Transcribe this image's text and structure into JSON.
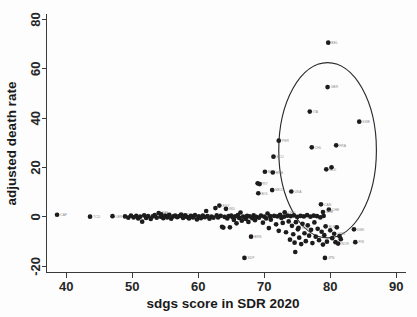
{
  "chart_data": {
    "type": "scatter",
    "title": "",
    "xlabel": "sdgs score in SDR 2020",
    "ylabel": "adjusted death rate",
    "xlim": [
      37,
      90.5
    ],
    "ylim": [
      -22.5,
      82
    ],
    "xticks": [
      40,
      50,
      60,
      70,
      80,
      90
    ],
    "yticks": [
      -20,
      0,
      20,
      40,
      60,
      80
    ],
    "grid": false,
    "legend": null,
    "marker_color": "#1c1c1c",
    "label_color": "#8a8a8a",
    "axis_color": "#3a3a3a",
    "background": "#fdfdfd",
    "annotations": [
      {
        "kind": "ellipse",
        "name": "highlight-ellipse",
        "cx": 79.6,
        "cy": 27.0,
        "rx": 7.4,
        "ry": 35.5,
        "stroke": "#2b2b2b",
        "encloses": [
          "BEL",
          "GBR",
          "ITA",
          "SWE",
          "PER",
          "CHL",
          "FRA",
          "ECU",
          "NLD",
          "USA",
          "CAN",
          "CHE"
        ]
      }
    ],
    "points": [
      {
        "label": "CAF",
        "x": 38.6,
        "y": 0.9
      },
      {
        "label": "TCD",
        "x": 43.6,
        "y": 0.1
      },
      {
        "label": "LBR",
        "x": 47.0,
        "y": 0.3
      },
      {
        "label": "",
        "x": 48.9,
        "y": 0.2
      },
      {
        "label": "",
        "x": 49.4,
        "y": -0.3
      },
      {
        "label": "",
        "x": 49.8,
        "y": 0.5
      },
      {
        "label": "",
        "x": 50.2,
        "y": -0.2
      },
      {
        "label": "",
        "x": 50.6,
        "y": 0.4
      },
      {
        "label": "",
        "x": 50.9,
        "y": -0.6
      },
      {
        "label": "",
        "x": 51.2,
        "y": 0.1
      },
      {
        "label": "",
        "x": 51.5,
        "y": -1.9
      },
      {
        "label": "",
        "x": 51.8,
        "y": 0.6
      },
      {
        "label": "",
        "x": 52.1,
        "y": -0.4
      },
      {
        "label": "",
        "x": 52.4,
        "y": 0.3
      },
      {
        "label": "",
        "x": 52.8,
        "y": -0.8
      },
      {
        "label": "",
        "x": 53.1,
        "y": 0.2
      },
      {
        "label": "",
        "x": 53.4,
        "y": 0.7
      },
      {
        "label": "",
        "x": 53.7,
        "y": -0.3
      },
      {
        "label": "ZAF",
        "x": 54.0,
        "y": 1.6
      },
      {
        "label": "",
        "x": 54.3,
        "y": 0.1
      },
      {
        "label": "LAO",
        "x": 54.4,
        "y": 1.1
      },
      {
        "label": "",
        "x": 54.7,
        "y": -0.5
      },
      {
        "label": "",
        "x": 55.0,
        "y": 0.4
      },
      {
        "label": "",
        "x": 55.3,
        "y": -0.2
      },
      {
        "label": "",
        "x": 55.6,
        "y": 0.8
      },
      {
        "label": "",
        "x": 55.9,
        "y": -0.7
      },
      {
        "label": "",
        "x": 56.2,
        "y": 0.2
      },
      {
        "label": "",
        "x": 56.5,
        "y": 0.5
      },
      {
        "label": "",
        "x": 56.8,
        "y": -0.1
      },
      {
        "label": "",
        "x": 57.1,
        "y": 0.3
      },
      {
        "label": "HTI",
        "x": 57.4,
        "y": 1.0
      },
      {
        "label": "",
        "x": 57.7,
        "y": -0.4
      },
      {
        "label": "",
        "x": 58.0,
        "y": 0.6
      },
      {
        "label": "",
        "x": 58.3,
        "y": 0.0
      },
      {
        "label": "",
        "x": 58.6,
        "y": -0.6
      },
      {
        "label": "",
        "x": 58.9,
        "y": 0.4
      },
      {
        "label": "",
        "x": 59.2,
        "y": -0.2
      },
      {
        "label": "",
        "x": 59.5,
        "y": 0.7
      },
      {
        "label": "",
        "x": 59.8,
        "y": -1.0
      },
      {
        "label": "",
        "x": 60.1,
        "y": 0.2
      },
      {
        "label": "",
        "x": 60.4,
        "y": -0.5
      },
      {
        "label": "",
        "x": 60.7,
        "y": 0.5
      },
      {
        "label": "",
        "x": 61.0,
        "y": -0.1
      },
      {
        "label": "",
        "x": 61.2,
        "y": 2.4
      },
      {
        "label": "",
        "x": 61.4,
        "y": 0.3
      },
      {
        "label": "",
        "x": 61.7,
        "y": -0.7
      },
      {
        "label": "",
        "x": 62.0,
        "y": 0.1
      },
      {
        "label": "",
        "x": 62.3,
        "y": -0.3
      },
      {
        "label": "",
        "x": 62.6,
        "y": 3.6
      },
      {
        "label": "",
        "x": 62.8,
        "y": 0.6
      },
      {
        "label": "",
        "x": 63.0,
        "y": -0.2
      },
      {
        "label": "EGY",
        "x": 63.2,
        "y": 4.6
      },
      {
        "label": "",
        "x": 63.4,
        "y": 0.4
      },
      {
        "label": "",
        "x": 63.6,
        "y": -4.0
      },
      {
        "label": "",
        "x": 63.8,
        "y": -4.3
      },
      {
        "label": "",
        "x": 64.0,
        "y": 0.0
      },
      {
        "label": "IND",
        "x": 64.2,
        "y": 3.3
      },
      {
        "label": "",
        "x": 64.4,
        "y": -0.6
      },
      {
        "label": "",
        "x": 64.6,
        "y": 0.3
      },
      {
        "label": "",
        "x": 64.8,
        "y": -4.2
      },
      {
        "label": "",
        "x": 65.0,
        "y": 0.5
      },
      {
        "label": "",
        "x": 65.2,
        "y": -0.1
      },
      {
        "label": "",
        "x": 65.4,
        "y": -1.2
      },
      {
        "label": "",
        "x": 65.6,
        "y": 0.2
      },
      {
        "label": "",
        "x": 65.8,
        "y": -2.6
      },
      {
        "label": "",
        "x": 66.0,
        "y": 0.7
      },
      {
        "label": "",
        "x": 66.2,
        "y": -0.4
      },
      {
        "label": "",
        "x": 66.4,
        "y": 1.8
      },
      {
        "label": "",
        "x": 66.6,
        "y": -1.5
      },
      {
        "label": "",
        "x": 66.8,
        "y": 0.1
      },
      {
        "label": "SDP",
        "x": 67.0,
        "y": -16.6
      },
      {
        "label": "",
        "x": 67.2,
        "y": -0.8
      },
      {
        "label": "",
        "x": 67.4,
        "y": 0.4
      },
      {
        "label": "",
        "x": 67.6,
        "y": -2.0
      },
      {
        "label": "",
        "x": 67.8,
        "y": 0.2
      },
      {
        "label": "BRN",
        "x": 68.0,
        "y": -8.0
      },
      {
        "label": "",
        "x": 68.2,
        "y": -0.5
      },
      {
        "label": "",
        "x": 68.4,
        "y": 0.6
      },
      {
        "label": "",
        "x": 68.6,
        "y": -1.3
      },
      {
        "label": "",
        "x": 68.8,
        "y": 0.0
      },
      {
        "label": "PRY",
        "x": 69.0,
        "y": 13.6
      },
      {
        "label": "",
        "x": 69.3,
        "y": 13.3
      },
      {
        "label": "BOL",
        "x": 69.1,
        "y": 9.6
      },
      {
        "label": "MEX",
        "x": 70.1,
        "y": 18.3
      },
      {
        "label": "",
        "x": 69.2,
        "y": -0.3
      },
      {
        "label": "",
        "x": 69.5,
        "y": 0.5
      },
      {
        "label": "",
        "x": 69.8,
        "y": -2.3
      },
      {
        "label": "",
        "x": 70.0,
        "y": 0.1
      },
      {
        "label": "",
        "x": 70.3,
        "y": -0.6
      },
      {
        "label": "",
        "x": 70.5,
        "y": 1.4
      },
      {
        "label": "",
        "x": 70.7,
        "y": -4.5
      },
      {
        "label": "",
        "x": 70.9,
        "y": 0.3
      },
      {
        "label": "MKD",
        "x": 71.2,
        "y": 10.9
      },
      {
        "label": "BRA",
        "x": 71.3,
        "y": 18.0
      },
      {
        "label": "ECU",
        "x": 71.4,
        "y": 24.4
      },
      {
        "label": "",
        "x": 71.0,
        "y": -1.1
      },
      {
        "label": "",
        "x": 71.5,
        "y": 0.4
      },
      {
        "label": "",
        "x": 71.8,
        "y": -3.0
      },
      {
        "label": "",
        "x": 72.0,
        "y": 0.2
      },
      {
        "label": "",
        "x": 72.2,
        "y": -5.6
      },
      {
        "label": "",
        "x": 72.4,
        "y": 0.8
      },
      {
        "label": "",
        "x": 72.6,
        "y": -0.4
      },
      {
        "label": "",
        "x": 72.8,
        "y": -2.4
      },
      {
        "label": "",
        "x": 73.0,
        "y": 0.1
      },
      {
        "label": "CHN",
        "x": 73.1,
        "y": 1.9
      },
      {
        "label": "",
        "x": 73.3,
        "y": -6.2
      },
      {
        "label": "",
        "x": 73.5,
        "y": 0.5
      },
      {
        "label": "",
        "x": 73.7,
        "y": -1.8
      },
      {
        "label": "",
        "x": 73.9,
        "y": -9.2
      },
      {
        "label": "USA",
        "x": 74.1,
        "y": 10.3
      },
      {
        "label": "",
        "x": 74.0,
        "y": 0.3
      },
      {
        "label": "",
        "x": 74.2,
        "y": -3.6
      },
      {
        "label": "",
        "x": 74.4,
        "y": -7.0
      },
      {
        "label": "",
        "x": 74.6,
        "y": -10.4
      },
      {
        "label": "",
        "x": 74.5,
        "y": 0.6
      },
      {
        "label": "",
        "x": 74.7,
        "y": -14.2
      },
      {
        "label": "",
        "x": 74.8,
        "y": -2.1
      },
      {
        "label": "",
        "x": 75.0,
        "y": 0.0
      },
      {
        "label": "",
        "x": 75.1,
        "y": -5.0
      },
      {
        "label": "ROU",
        "x": 75.2,
        "y": -4.4
      },
      {
        "label": "",
        "x": 75.3,
        "y": -8.4
      },
      {
        "label": "",
        "x": 75.5,
        "y": 0.4
      },
      {
        "label": "",
        "x": 75.6,
        "y": -11.0
      },
      {
        "label": "",
        "x": 75.8,
        "y": -2.8
      },
      {
        "label": "",
        "x": 76.0,
        "y": 0.2
      },
      {
        "label": "",
        "x": 76.1,
        "y": -6.6
      },
      {
        "label": "",
        "x": 76.3,
        "y": -9.8
      },
      {
        "label": "",
        "x": 76.5,
        "y": 0.7
      },
      {
        "label": "",
        "x": 76.6,
        "y": -3.4
      },
      {
        "label": "",
        "x": 76.8,
        "y": -7.6
      },
      {
        "label": "ITA",
        "x": 76.9,
        "y": 42.7
      },
      {
        "label": "",
        "x": 77.0,
        "y": 0.1
      },
      {
        "label": "CHL",
        "x": 77.2,
        "y": 28.2
      },
      {
        "label": "",
        "x": 77.1,
        "y": -5.2
      },
      {
        "label": "",
        "x": 77.3,
        "y": -10.6
      },
      {
        "label": "",
        "x": 77.5,
        "y": 0.5
      },
      {
        "label": "",
        "x": 77.6,
        "y": -2.2
      },
      {
        "label": "",
        "x": 77.8,
        "y": -8.0
      },
      {
        "label": "",
        "x": 78.0,
        "y": 0.3
      },
      {
        "label": "PER",
        "x": 72.2,
        "y": 30.9
      },
      {
        "label": "",
        "x": 78.1,
        "y": -4.8
      },
      {
        "label": "",
        "x": 78.3,
        "y": -9.4
      },
      {
        "label": "",
        "x": 78.5,
        "y": -0.2
      },
      {
        "label": "CAN",
        "x": 78.6,
        "y": 5.1
      },
      {
        "label": "",
        "x": 78.7,
        "y": -6.0
      },
      {
        "label": "",
        "x": 78.9,
        "y": -11.2
      },
      {
        "label": "BEL",
        "x": 79.7,
        "y": 70.6
      },
      {
        "label": "GBR",
        "x": 79.6,
        "y": 52.6
      },
      {
        "label": "NLD",
        "x": 79.4,
        "y": 19.3
      },
      {
        "label": "",
        "x": 79.0,
        "y": 0.4
      },
      {
        "label": "BLR",
        "x": 79.3,
        "y": -3.8
      },
      {
        "label": "",
        "x": 79.1,
        "y": -7.4
      },
      {
        "label": "JPN",
        "x": 79.2,
        "y": -16.6
      },
      {
        "label": "",
        "x": 79.5,
        "y": -10.0
      },
      {
        "label": "CHE",
        "x": 79.8,
        "y": 3.0
      },
      {
        "label": "SRB",
        "x": 78.9,
        "y": 2.0
      },
      {
        "label": "FRA",
        "x": 80.9,
        "y": 29.0
      },
      {
        "label": "NLD2",
        "x": 80.2,
        "y": 20.1
      },
      {
        "label": "",
        "x": 80.0,
        "y": -5.4
      },
      {
        "label": "",
        "x": 80.3,
        "y": -8.6
      },
      {
        "label": "GRN",
        "x": 80.6,
        "y": -6.8
      },
      {
        "label": "",
        "x": 80.8,
        "y": -10.2
      },
      {
        "label": "",
        "x": 81.0,
        "y": -4.2
      },
      {
        "label": "NOR",
        "x": 81.2,
        "y": -10.8
      },
      {
        "label": "",
        "x": 81.4,
        "y": -7.8
      },
      {
        "label": "",
        "x": 81.6,
        "y": -9.0
      },
      {
        "label": "SWE",
        "x": 84.4,
        "y": 38.6
      },
      {
        "label": "DNK",
        "x": 83.6,
        "y": -5.0
      },
      {
        "label": "FIN",
        "x": 83.8,
        "y": -10.2
      }
    ]
  }
}
